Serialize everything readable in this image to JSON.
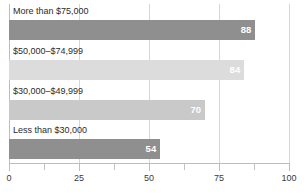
{
  "chart_data": {
    "type": "bar",
    "orientation": "horizontal",
    "title": "",
    "subtitle": "",
    "xlabel": "",
    "ylabel": "",
    "xlim": [
      0,
      100
    ],
    "grid": true,
    "legend": false,
    "categories": [
      "More than $75,000",
      "$50,000–$74,999",
      "$30,000–$49,999",
      "Less than $30,000"
    ],
    "values": [
      88,
      84,
      70,
      54
    ],
    "value_labels": [
      "88",
      "84",
      "70",
      "54"
    ],
    "bar_colors": [
      "#8f8f8f",
      "#dcdcdc",
      "#c9c9c9",
      "#8f8f8f"
    ],
    "value_label_color": "#ffffff",
    "xticks": [
      0,
      25,
      50,
      75,
      100
    ],
    "xtick_labels": [
      "0",
      "25",
      "50",
      "75",
      "100"
    ],
    "xminorticks": [
      12.5,
      37.5,
      62.5,
      87.5
    ],
    "gridline_color": "#d6d6d6",
    "axis_color": "#bdbdbd",
    "background": "#ffffff"
  }
}
